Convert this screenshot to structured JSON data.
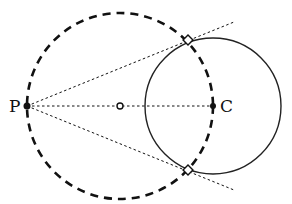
{
  "diagram": {
    "labels": {
      "point_p": "P",
      "point_c": "C"
    },
    "elements": [
      "dashed circle (Thales circle on PC)",
      "solid circle centered at C",
      "dotted tangent lines from P",
      "dotted line PC with midpoint",
      "tangent points (open squares)"
    ],
    "colors": {
      "stroke": "#111111",
      "background": "#ffffff"
    }
  }
}
